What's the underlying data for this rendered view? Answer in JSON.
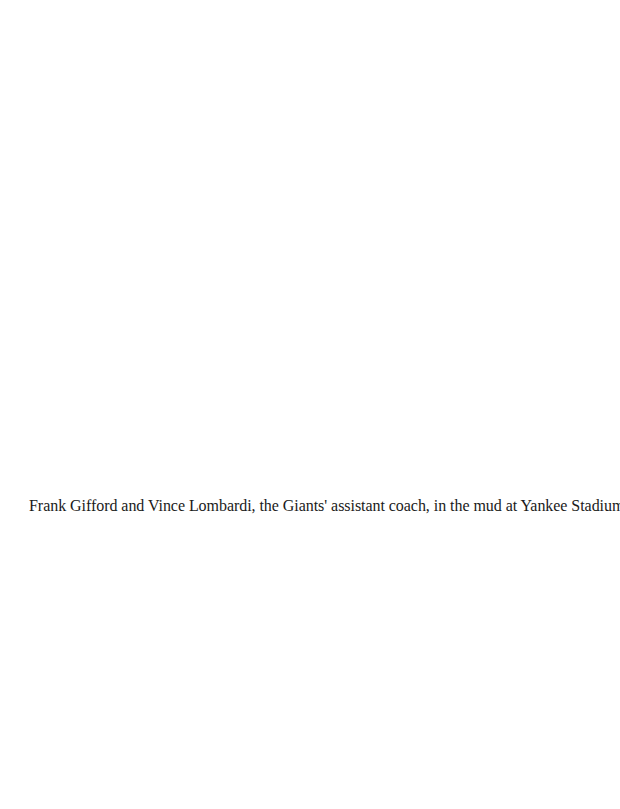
{
  "page": {
    "background": "#ffffff",
    "text_color": "#1a1a1a"
  },
  "caption": {
    "text": "Frank Gifford and Vince Lombardi, the Giants' assistant coach, in the mud at Yankee Stadium, 1956."
  }
}
